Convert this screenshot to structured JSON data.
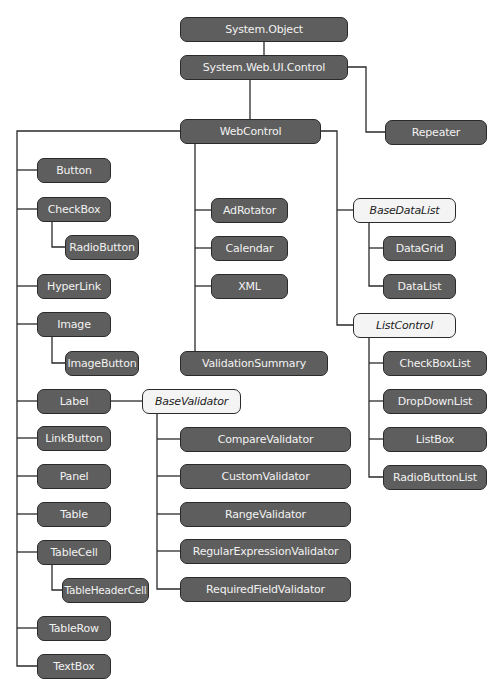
{
  "diagram": {
    "colors": {
      "concrete_fill": "#5e5e5e",
      "abstract_fill": "#f4f4f4",
      "line": "#2a2a2a",
      "text_light": "#f2f2f2",
      "text_dark": "#222222"
    },
    "nodes": {
      "system_object": "System.Object",
      "system_web_ui_control": "System.Web.UI.Control",
      "repeater": "Repeater",
      "webcontrol": "WebControl",
      "button": "Button",
      "checkbox": "CheckBox",
      "radiobutton": "RadioButton",
      "hyperlink": "HyperLink",
      "image": "Image",
      "imagebutton": "ImageButton",
      "label": "Label",
      "linkbutton": "LinkButton",
      "panel": "Panel",
      "table": "Table",
      "tablecell": "TableCell",
      "tableheadercell": "TableHeaderCell",
      "tablerow": "TableRow",
      "textbox": "TextBox",
      "adrotator": "AdRotator",
      "calendar": "Calendar",
      "xml": "XML",
      "validationsummary": "ValidationSummary",
      "basedatalist": "BaseDataList",
      "datagrid": "DataGrid",
      "datalist": "DataList",
      "listcontrol": "ListControl",
      "checkboxlist": "CheckBoxList",
      "dropdownlist": "DropDownList",
      "listbox": "ListBox",
      "radiobuttonlist": "RadioButtonList",
      "basevalidator": "BaseValidator",
      "comparevalidator": "CompareValidator",
      "customvalidator": "CustomValidator",
      "rangevalidator": "RangeValidator",
      "regularexpressionvalidator": "RegularExpressionValidator",
      "requiredfieldvalidator": "RequiredFieldValidator"
    },
    "abstract_nodes": [
      "BaseDataList",
      "ListControl",
      "BaseValidator"
    ]
  }
}
